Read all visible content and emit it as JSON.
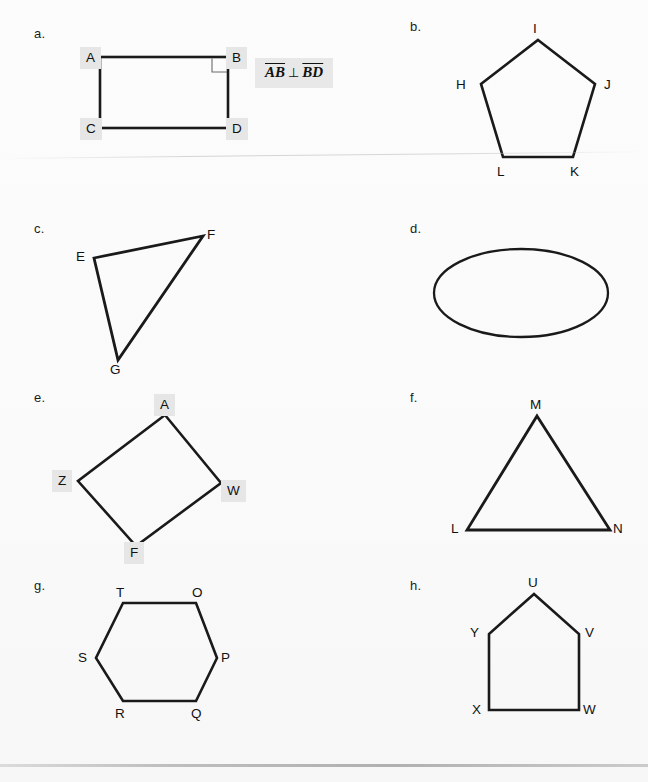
{
  "worksheet": {
    "title": "Geometry figures worksheet",
    "background_color": "#fbfbfb",
    "stroke_color": "#1a1a1a",
    "highlight_color": "#e6e6e6"
  },
  "items": [
    {
      "id": "a",
      "letter": "a.",
      "shape": "rectangle",
      "vertices": [
        {
          "label": "A",
          "highlighted": true
        },
        {
          "label": "B",
          "highlighted": true
        },
        {
          "label": "C",
          "highlighted": true
        },
        {
          "label": "D",
          "highlighted": true
        }
      ],
      "right_angle_at": "B",
      "notation": {
        "left_segment": "AB",
        "symbol": "⊥",
        "right_segment": "BD",
        "full_text": "AB ⊥ BD"
      }
    },
    {
      "id": "b",
      "letter": "b.",
      "shape": "pentagon",
      "vertices": [
        {
          "label": "I",
          "highlighted": false
        },
        {
          "label": "H",
          "highlighted": false
        },
        {
          "label": "J",
          "highlighted": false
        },
        {
          "label": "L",
          "highlighted": false
        },
        {
          "label": "K",
          "highlighted": false
        }
      ]
    },
    {
      "id": "c",
      "letter": "c.",
      "shape": "triangle",
      "vertices": [
        {
          "label": "E",
          "highlighted": false
        },
        {
          "label": "F",
          "highlighted": false
        },
        {
          "label": "G",
          "highlighted": false
        }
      ]
    },
    {
      "id": "d",
      "letter": "d.",
      "shape": "ellipse",
      "vertices": []
    },
    {
      "id": "e",
      "letter": "e.",
      "shape": "quadrilateral",
      "vertices": [
        {
          "label": "A",
          "highlighted": true
        },
        {
          "label": "W",
          "highlighted": true
        },
        {
          "label": "F",
          "highlighted": true
        },
        {
          "label": "Z",
          "highlighted": true
        }
      ]
    },
    {
      "id": "f",
      "letter": "f.",
      "shape": "triangle",
      "vertices": [
        {
          "label": "M",
          "highlighted": false
        },
        {
          "label": "L",
          "highlighted": false
        },
        {
          "label": "N",
          "highlighted": false
        }
      ]
    },
    {
      "id": "g",
      "letter": "g.",
      "shape": "hexagon",
      "vertices": [
        {
          "label": "T",
          "highlighted": false
        },
        {
          "label": "O",
          "highlighted": false
        },
        {
          "label": "P",
          "highlighted": false
        },
        {
          "label": "Q",
          "highlighted": false
        },
        {
          "label": "R",
          "highlighted": false
        },
        {
          "label": "S",
          "highlighted": false
        }
      ]
    },
    {
      "id": "h",
      "letter": "h.",
      "shape": "pentagon-house",
      "vertices": [
        {
          "label": "U",
          "highlighted": false
        },
        {
          "label": "Y",
          "highlighted": false
        },
        {
          "label": "V",
          "highlighted": false
        },
        {
          "label": "X",
          "highlighted": false
        },
        {
          "label": "W",
          "highlighted": false
        }
      ]
    }
  ]
}
